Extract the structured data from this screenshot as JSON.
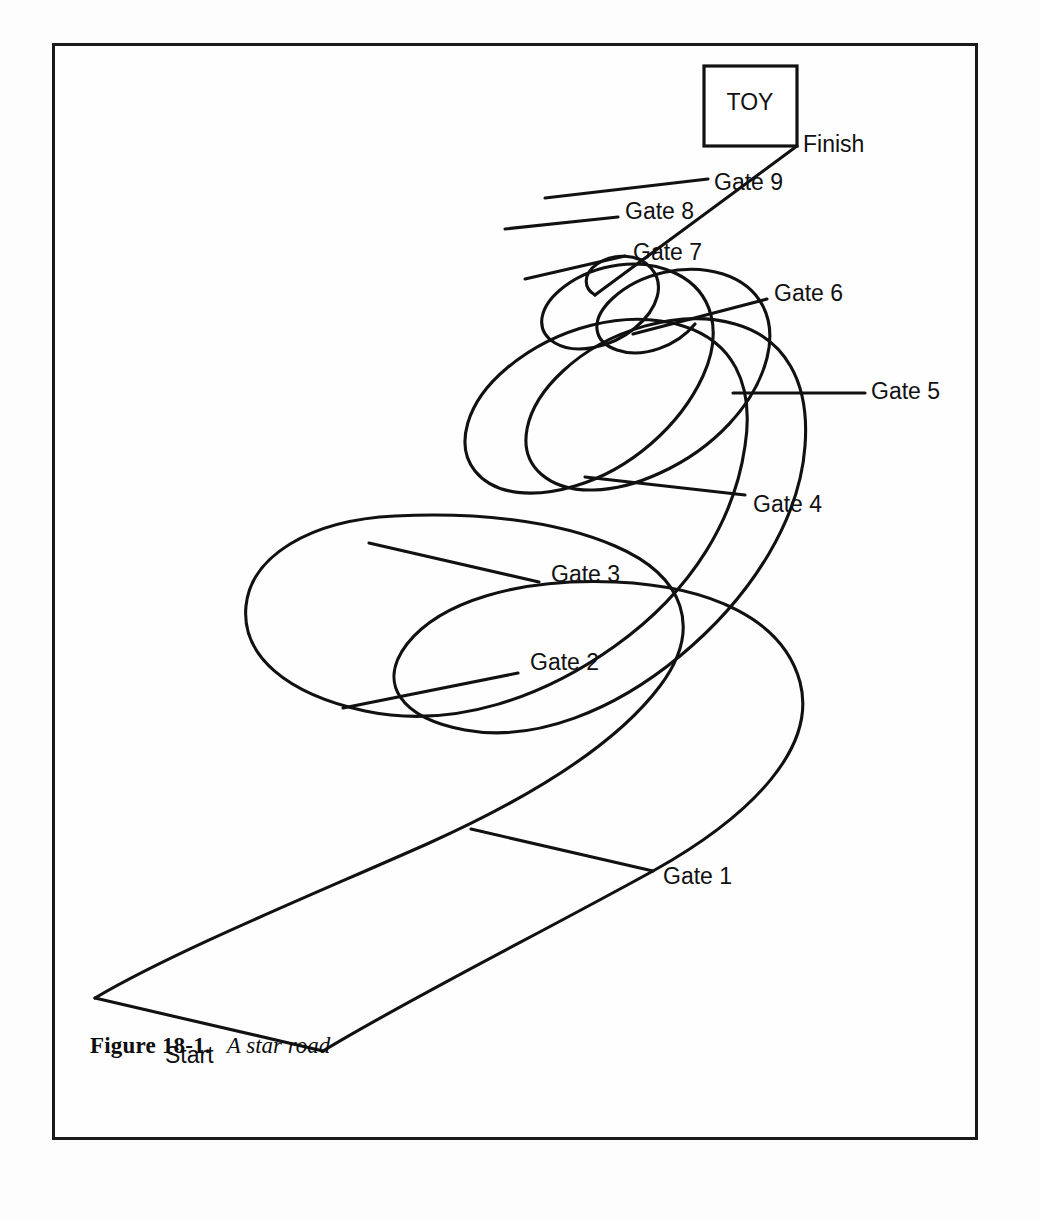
{
  "figure": {
    "caption_number": "Figure 18-1.",
    "caption_title": "A star road",
    "frame": {
      "x": 52,
      "y": 43,
      "width": 926,
      "height": 1097,
      "border_color": "#1a1a1a"
    },
    "background_color": "#ffffff",
    "ink_color": "#111111"
  },
  "diagram": {
    "type": "road-map",
    "title": "A star road",
    "destination_box": {
      "label": "TOY",
      "x": 649,
      "y": 20,
      "width": 93,
      "height": 80
    },
    "start_label": "Start",
    "finish_label": "Finish",
    "gate_count": 9,
    "gates": [
      {
        "name": "Gate 1",
        "label_x": 608,
        "label_y": 832,
        "line": {
          "x1": 416,
          "y1": 783,
          "x2": 598,
          "y2": 825
        }
      },
      {
        "name": "Gate 2",
        "label_x": 475,
        "label_y": 618,
        "line": {
          "x1": 288,
          "y1": 662,
          "x2": 463,
          "y2": 627
        }
      },
      {
        "name": "Gate 3",
        "label_x": 496,
        "label_y": 530,
        "line": {
          "x1": 314,
          "y1": 497,
          "x2": 484,
          "y2": 536
        }
      },
      {
        "name": "Gate 4",
        "label_x": 698,
        "label_y": 460,
        "line": {
          "x1": 530,
          "y1": 431,
          "x2": 690,
          "y2": 449
        }
      },
      {
        "name": "Gate 5",
        "label_x": 816,
        "label_y": 347,
        "line": {
          "x1": 678,
          "y1": 347,
          "x2": 810,
          "y2": 347
        }
      },
      {
        "name": "Gate 6",
        "label_x": 719,
        "label_y": 249,
        "line": {
          "x1": 578,
          "y1": 288,
          "x2": 712,
          "y2": 253
        }
      },
      {
        "name": "Gate 7",
        "label_x": 578,
        "label_y": 208,
        "line": {
          "x1": 470,
          "y1": 233,
          "x2": 570,
          "y2": 210
        }
      },
      {
        "name": "Gate 8",
        "label_x": 570,
        "label_y": 167,
        "line": {
          "x1": 450,
          "y1": 183,
          "x2": 563,
          "y2": 171
        }
      },
      {
        "name": "Gate 9",
        "label_x": 659,
        "label_y": 138,
        "line": {
          "x1": 490,
          "y1": 152,
          "x2": 653,
          "y2": 133
        }
      }
    ],
    "labels": {
      "start": {
        "text": "Start",
        "x": 110,
        "y": 1011
      },
      "finish": {
        "text": "Finish",
        "x": 745,
        "y": 100
      },
      "toy": {
        "text": "TOY",
        "x": 695,
        "y": 58
      }
    },
    "road_outer_edge": "M 40 952 C 120 905, 250 852, 372 798 C 470 754, 560 700, 605 640 C 648 583, 630 530, 560 500 C 500 474, 420 466, 340 470 C 255 474, 196 510, 191 560 C 186 610, 232 648, 310 665 C 400 684, 490 650, 560 600 C 640 543, 680 470, 690 400 C 700 336, 676 295, 628 280 C 570 262, 500 282, 452 322 C 410 357, 400 400, 420 425 C 440 450, 480 452, 520 440 C 575 424, 625 380, 648 330 C 668 286, 658 246, 622 228 C 586 210, 540 218, 510 240 C 482 261, 480 285, 500 297 C 520 309, 556 302, 580 282 C 604 262, 610 238, 596 222 C 583 207, 558 207, 542 218 C 528 228, 528 242, 540 249",
    "road_inner_edge": "M 268 1005 C 350 955, 480 890, 598 825 C 700 768, 762 700, 745 636 C 728 573, 655 540, 560 536 C 462 532, 385 556, 352 598 C 322 637, 345 672, 410 684 C 480 697, 560 664, 625 610 C 700 548, 745 470, 750 400 C 755 336, 730 292, 680 278 C 624 262, 552 284, 508 325 C 468 362, 460 405, 486 428 C 512 451, 560 448, 605 427 C 660 402, 700 358, 712 312 C 722 272, 705 240, 668 228 C 630 216, 584 228, 558 252 C 534 274, 538 296, 562 304 C 588 313, 622 300, 640 278"
  }
}
